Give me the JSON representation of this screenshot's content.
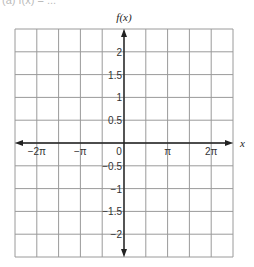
{
  "header_fragment": "(a) f(x) = ...",
  "chart_data": {
    "type": "line",
    "title": "",
    "xlabel": "x",
    "ylabel": "f(x)",
    "xlim": [
      -7.85,
      7.85
    ],
    "ylim": [
      -2.5,
      2.5
    ],
    "grid": true,
    "x_ticks": [
      {
        "value": -6.2832,
        "label": "−2π"
      },
      {
        "value": -3.1416,
        "label": "−π"
      },
      {
        "value": 0,
        "label": "0"
      },
      {
        "value": 3.1416,
        "label": "π"
      },
      {
        "value": 6.2832,
        "label": "2π"
      }
    ],
    "y_ticks": [
      {
        "value": 2,
        "label": "2"
      },
      {
        "value": 1.5,
        "label": "1.5"
      },
      {
        "value": 1,
        "label": "1"
      },
      {
        "value": 0.5,
        "label": "0.5"
      },
      {
        "value": -0.5,
        "label": "−0.5"
      },
      {
        "value": -1,
        "label": "−1"
      },
      {
        "value": -1.5,
        "label": "−1.5"
      },
      {
        "value": -2,
        "label": "−2"
      }
    ],
    "grid_columns": 10,
    "grid_rows": 10,
    "series": []
  },
  "colors": {
    "grid": "#9a9a9a",
    "axis": "#222222",
    "text": "#333333"
  }
}
